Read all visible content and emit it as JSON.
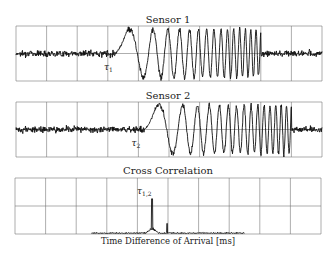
{
  "chart_data": [
    {
      "type": "line",
      "title": "Sensor 1",
      "xlabel": "",
      "ylabel": "",
      "grid": true,
      "grid_columns": 10,
      "grid_rows": 2,
      "annotation": {
        "label": "τ",
        "subscript": "1",
        "x_fraction": 0.32
      },
      "signal": {
        "noise_amplitude": 0.35,
        "burst_start_fraction": 0.325,
        "burst_end_fraction": 0.8,
        "burst_amplitude": 0.95,
        "description": "noise, then chirp burst with increasing frequency, then noise"
      },
      "plot_box": {
        "x": 16,
        "y": 26,
        "w": 306,
        "h": 55
      }
    },
    {
      "type": "line",
      "title": "Sensor 2",
      "xlabel": "",
      "ylabel": "",
      "grid": true,
      "grid_columns": 10,
      "grid_rows": 2,
      "annotation": {
        "label": "τ",
        "subscript": "2",
        "x_fraction": 0.41
      },
      "signal": {
        "noise_amplitude": 0.35,
        "burst_start_fraction": 0.42,
        "burst_end_fraction": 0.9,
        "burst_amplitude": 0.95,
        "description": "same chirp burst as Sensor 1, delayed"
      },
      "plot_box": {
        "x": 16,
        "y": 102,
        "w": 306,
        "h": 55
      }
    },
    {
      "type": "line",
      "title": "Cross Correlation",
      "xlabel": "Time Difference of Arrival [ms]",
      "ylabel": "",
      "grid": true,
      "grid_columns": 10,
      "grid_rows": 2,
      "annotation": {
        "label": "τ",
        "subscript": "1,2",
        "x_fraction": 0.448
      },
      "signal": {
        "peak_x_fraction": 0.448,
        "peak_height_fraction": 0.62,
        "secondary_spike_x_fraction": 0.497,
        "secondary_spike_height_fraction": 0.18,
        "baseline_start_fraction": 0.25,
        "baseline_end_fraction": 0.75,
        "baseline_noise_fraction": 0.03
      },
      "plot_box": {
        "x": 15,
        "y": 178,
        "w": 306,
        "h": 56
      }
    }
  ],
  "titles": {
    "sensor1": "Sensor 1",
    "sensor2": "Sensor 2",
    "xcorr": "Cross Correlation"
  },
  "xcorr_xlabel": "Time Difference of Arrival [ms]",
  "colors": {
    "grid": "#777777",
    "signal": "#111111",
    "background": "#ffffff"
  }
}
